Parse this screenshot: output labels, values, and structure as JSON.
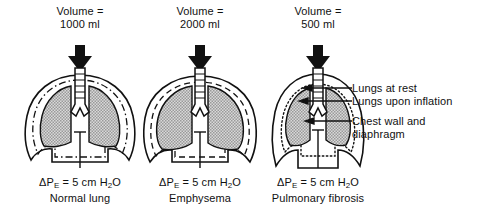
{
  "figure": {
    "background": "#ffffff",
    "ink": "#111111",
    "lung_fill": "#b4b4b4"
  },
  "panels": [
    {
      "id": "normal-lung",
      "volume_label": "Volume =",
      "volume_value": "1000 ml",
      "pressure_prefix": "ΔP",
      "pressure_sub": "E",
      "pressure_rest": " = 5 cm H",
      "pressure_sub2": "2",
      "pressure_tail": "O",
      "diagnosis": "Normal lung",
      "inner_line_style": "dash-dot"
    },
    {
      "id": "emphysema",
      "volume_label": "Volume =",
      "volume_value": "2000 ml",
      "pressure_prefix": "ΔP",
      "pressure_sub": "E",
      "pressure_rest": " = 5 cm H",
      "pressure_sub2": "2",
      "pressure_tail": "O",
      "diagnosis": "Emphysema",
      "inner_line_style": "dashed"
    },
    {
      "id": "pulmonary-fibrosis",
      "volume_label": "Volume =",
      "volume_value": "500 ml",
      "pressure_prefix": "ΔP",
      "pressure_sub": "E",
      "pressure_rest": " = 5 cm H",
      "pressure_sub2": "2",
      "pressure_tail": "O",
      "diagnosis": "Pulmonary fibrosis",
      "inner_line_style": "dotted"
    }
  ],
  "annotations": [
    {
      "id": "lungs-at-rest",
      "line1": "Lungs at rest",
      "line2": ""
    },
    {
      "id": "lungs-upon-inflation",
      "line1": "Lungs upon inflation",
      "line2": ""
    },
    {
      "id": "chest-wall-and-diaphragm",
      "line1": "Chest wall and",
      "line2": "diaphragm"
    }
  ]
}
